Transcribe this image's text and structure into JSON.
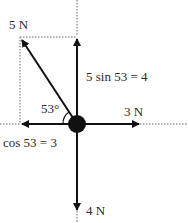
{
  "diagram": {
    "labels": {
      "force_5n": "5 N",
      "vertical_component": "5 sin 53 = 4",
      "angle": "53°",
      "force_3n": "3 N",
      "horizontal_component": "cos 53 = 3",
      "force_4n": "4 N"
    },
    "colors": {
      "line": "#111111",
      "dotted": "#555555",
      "text": "#2a2a2a"
    }
  }
}
